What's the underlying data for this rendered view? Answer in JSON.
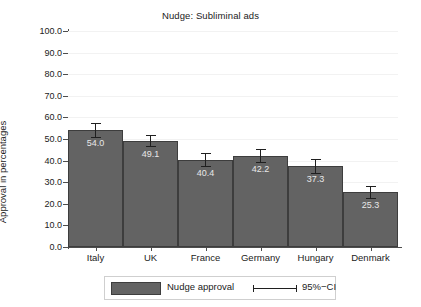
{
  "chart_data": {
    "type": "bar",
    "title": "Nudge: Subliminal ads",
    "xlabel": "",
    "ylabel": "Approval in percentages",
    "ylim": [
      0,
      100
    ],
    "ytick_step": 10,
    "ytick_labels": [
      "0.0",
      "10.0",
      "20.0",
      "30.0",
      "40.0",
      "50.0",
      "60.0",
      "70.0",
      "80.0",
      "90.0",
      "100.0"
    ],
    "grid": true,
    "legend_position": "bottom",
    "categories": [
      "Italy",
      "UK",
      "France",
      "Germany",
      "Hungary",
      "Denmark"
    ],
    "values": [
      54.0,
      49.1,
      40.4,
      42.2,
      37.3,
      25.3
    ],
    "value_labels": [
      "54.0",
      "49.1",
      "40.4",
      "42.2",
      "37.3",
      "25.3"
    ],
    "error_bars": {
      "description": "95%-CI",
      "lower": [
        50.6,
        46.2,
        37.2,
        39.0,
        34.0,
        22.4
      ],
      "upper": [
        57.4,
        52.0,
        43.6,
        45.4,
        40.6,
        28.2
      ]
    },
    "legend": [
      {
        "label": "Nudge approval",
        "marker": "bar-swatch",
        "color": "#636363"
      },
      {
        "label": "95%−CI",
        "marker": "errorbar-glyph",
        "color": "#1f1f1f"
      }
    ],
    "colors": {
      "bar_fill": "#636363",
      "bar_border": "#3d3d3d",
      "error_bar": "#1f1f1f",
      "value_label": "#e8e8e8",
      "axis": "#4d4d4d",
      "grid": "#f2f2f2",
      "background": "#ffffff",
      "text": "#222222"
    }
  }
}
